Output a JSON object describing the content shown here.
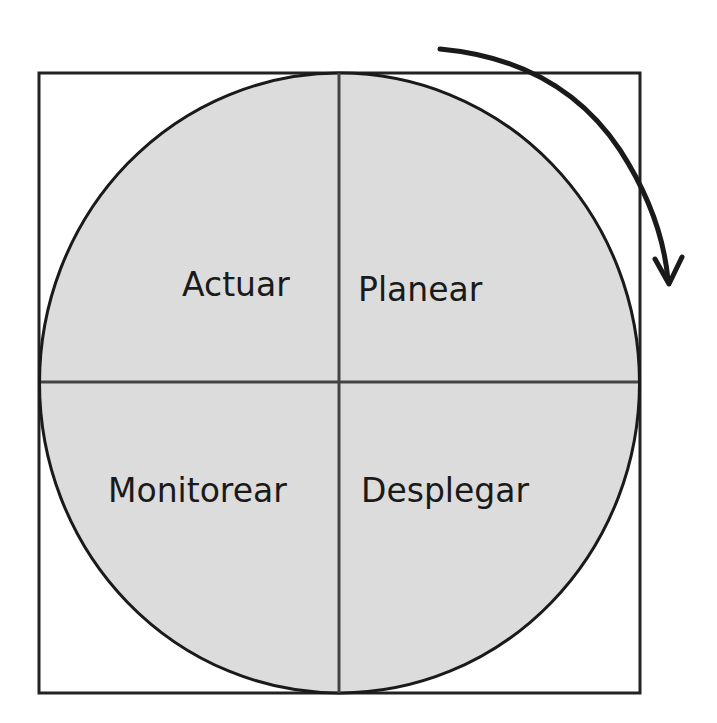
{
  "diagram": {
    "type": "cycle-quadrants",
    "direction": "clockwise",
    "colors": {
      "fill": "#dcdcdc",
      "stroke": "#1a1a1a",
      "divider": "#444444",
      "background": "#ffffff"
    },
    "quadrants": [
      {
        "position": "top-left",
        "label": "Actuar"
      },
      {
        "position": "top-right",
        "label": "Planear"
      },
      {
        "position": "bottom-left",
        "label": "Monitorear"
      },
      {
        "position": "bottom-right",
        "label": "Desplegar"
      }
    ],
    "arrow": {
      "icon": "clockwise-arrow-icon"
    }
  }
}
